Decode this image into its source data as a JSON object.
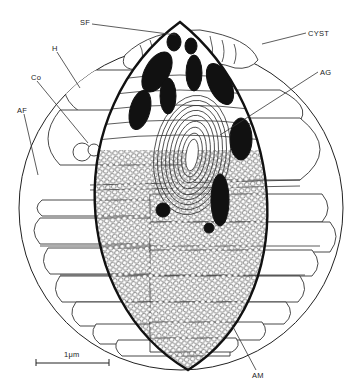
{
  "figure": {
    "labels": [
      {
        "id": "SF",
        "text": "SF",
        "x": 82,
        "y": 24,
        "target": [
          176,
          35
        ]
      },
      {
        "id": "CYST",
        "text": "CYST",
        "x": 308,
        "y": 35,
        "target": [
          262,
          44
        ]
      },
      {
        "id": "H",
        "text": "H",
        "x": 54,
        "y": 50,
        "target": [
          80,
          88
        ]
      },
      {
        "id": "AG",
        "text": "AG",
        "x": 320,
        "y": 73,
        "target": [
          220,
          135
        ]
      },
      {
        "id": "Co",
        "text": "Co",
        "x": 33,
        "y": 79,
        "target": [
          88,
          143
        ]
      },
      {
        "id": "AF",
        "text": "AF",
        "x": 19,
        "y": 112,
        "target": [
          38,
          175
        ]
      },
      {
        "id": "AM",
        "text": "AM",
        "x": 254,
        "y": 375,
        "target": [
          232,
          325
        ]
      }
    ],
    "scale_bar": {
      "label": "1μm",
      "x1": 36,
      "x2": 109,
      "y": 363
    }
  },
  "colors": {
    "ink": "#222222",
    "fill_dark": "#111111",
    "background": "#ffffff"
  }
}
